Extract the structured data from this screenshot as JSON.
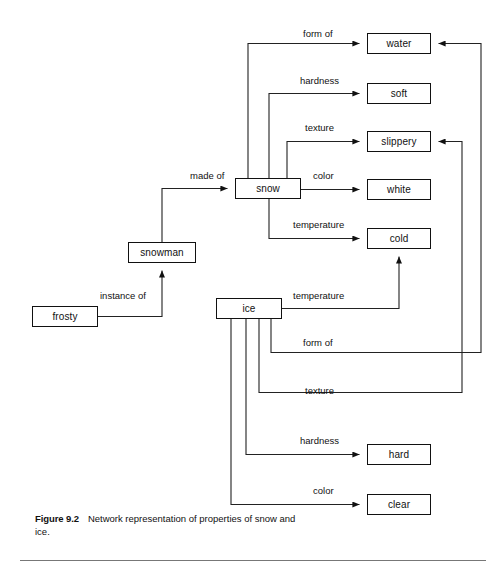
{
  "figure": {
    "caption_number": "Figure 9.2",
    "caption_text": "Network representation of properties of snow and ice."
  },
  "style": {
    "line_color": "#222222",
    "box_border_color": "#111111",
    "box_fill": "#ffffff",
    "text_color": "#111111",
    "rule_color": "#777777"
  },
  "nodes": [
    {
      "id": "water",
      "label": "water",
      "x": 367,
      "y": 33,
      "w": 64,
      "h": 21
    },
    {
      "id": "soft",
      "label": "soft",
      "x": 367,
      "y": 83,
      "w": 64,
      "h": 21
    },
    {
      "id": "slippery",
      "label": "slippery",
      "x": 367,
      "y": 131,
      "w": 64,
      "h": 21
    },
    {
      "id": "white",
      "label": "white",
      "x": 367,
      "y": 179,
      "w": 64,
      "h": 21
    },
    {
      "id": "cold",
      "label": "cold",
      "x": 367,
      "y": 228,
      "w": 64,
      "h": 21
    },
    {
      "id": "hard",
      "label": "hard",
      "x": 367,
      "y": 444,
      "w": 64,
      "h": 21
    },
    {
      "id": "clear",
      "label": "clear",
      "x": 367,
      "y": 494,
      "w": 64,
      "h": 21
    },
    {
      "id": "snow",
      "label": "snow",
      "x": 235,
      "y": 178,
      "w": 66,
      "h": 21
    },
    {
      "id": "ice",
      "label": "ice",
      "x": 216,
      "y": 298,
      "w": 66,
      "h": 21
    },
    {
      "id": "snowman",
      "label": "snowman",
      "x": 128,
      "y": 242,
      "w": 68,
      "h": 21
    },
    {
      "id": "frosty",
      "label": "frosty",
      "x": 32,
      "y": 306,
      "w": 66,
      "h": 21
    }
  ],
  "edges": [
    {
      "id": "snow-form-of-water",
      "source": "snow",
      "target": "water",
      "label": "form of",
      "label_x": 303,
      "label_y": 29
    },
    {
      "id": "snow-hardness-soft",
      "source": "snow",
      "target": "soft",
      "label": "hardness",
      "label_x": 300,
      "label_y": 76
    },
    {
      "id": "snow-texture-slippery",
      "source": "snow",
      "target": "slippery",
      "label": "texture",
      "label_x": 305,
      "label_y": 123
    },
    {
      "id": "snow-color-white",
      "source": "snow",
      "target": "white",
      "label": "color",
      "label_x": 313,
      "label_y": 171
    },
    {
      "id": "snow-temperature-cold",
      "source": "snow",
      "target": "cold",
      "label": "temperature",
      "label_x": 293,
      "label_y": 220
    },
    {
      "id": "snowman-made-of-snow",
      "source": "snowman",
      "target": "snow",
      "label": "made of",
      "label_x": 190,
      "label_y": 171
    },
    {
      "id": "frosty-instance-of-snowman",
      "source": "frosty",
      "target": "snowman",
      "label": "instance of",
      "label_x": 100,
      "label_y": 291
    },
    {
      "id": "ice-temperature-cold",
      "source": "ice",
      "target": "cold",
      "label": "temperature",
      "label_x": 293,
      "label_y": 291
    },
    {
      "id": "ice-form-of-water",
      "source": "ice",
      "target": "water",
      "label": "form of",
      "label_x": 303,
      "label_y": 338
    },
    {
      "id": "ice-texture-slippery",
      "source": "ice",
      "target": "slippery",
      "label": "texture",
      "label_x": 305,
      "label_y": 386
    },
    {
      "id": "ice-hardness-hard",
      "source": "ice",
      "target": "hard",
      "label": "hardness",
      "label_x": 300,
      "label_y": 436
    },
    {
      "id": "ice-color-clear",
      "source": "ice",
      "target": "clear",
      "label": "color",
      "label_x": 313,
      "label_y": 486
    }
  ]
}
